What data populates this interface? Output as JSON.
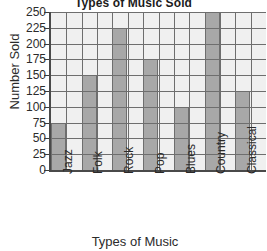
{
  "chart_data": {
    "type": "bar",
    "title": "Types of Music Sold",
    "xlabel": "Types of Music",
    "ylabel": "Number Sold",
    "categories": [
      "Jazz",
      "Folk",
      "Rock",
      "Pop",
      "Blues",
      "Country",
      "Classical"
    ],
    "values": [
      75,
      150,
      225,
      175,
      100,
      250,
      125
    ],
    "ylim": [
      0,
      250
    ],
    "ytick_labels": [
      "250",
      "225",
      "200",
      "175",
      "150",
      "125",
      "100",
      "75",
      "50",
      "25",
      "0"
    ],
    "ytick_values": [
      250,
      225,
      200,
      175,
      150,
      125,
      100,
      75,
      50,
      25,
      0
    ],
    "grid": true,
    "legend": "none",
    "colors": {
      "bar_fill": "#a8a8a8",
      "plot_background": "#f0f0f0",
      "grid_line": "#6e6e6e",
      "axis_line": "#4a4a4a",
      "text": "#2b2b2b"
    }
  }
}
